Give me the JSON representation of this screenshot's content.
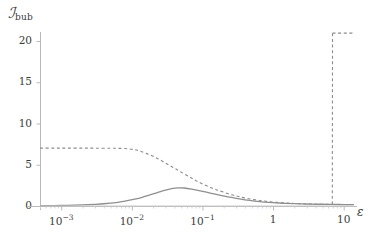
{
  "chart_data": {
    "type": "line",
    "title": "",
    "ylabel": "ℐ_bub",
    "ylabel_main": "ℐ",
    "ylabel_sub": "bub",
    "xlabel": "ε",
    "xscale": "log",
    "yscale": "linear",
    "xlim": [
      0.0005,
      14
    ],
    "ylim": [
      -0.9,
      22.5
    ],
    "yticks": [
      0,
      5,
      10,
      15,
      20
    ],
    "ytick_labels": [
      "0",
      "5",
      "10",
      "15",
      "20"
    ],
    "xticks": [
      0.001,
      0.01,
      0.1,
      1,
      10
    ],
    "xtick_labels": [
      "10−3",
      "10−2",
      "10−1",
      "1",
      "10"
    ],
    "xtick_mantissa": [
      "10",
      "10",
      "10",
      "1",
      "10"
    ],
    "xtick_exponent": [
      "-3",
      "-2",
      "-1",
      "",
      ""
    ],
    "grid": false,
    "legend": "none",
    "frame": false,
    "axis_color": "#b9b9b9",
    "series": [
      {
        "name": "dashed-step",
        "style": "dashed",
        "color": "#8c8c8c",
        "linewidth": 1.1,
        "dasharray": "3,2.6",
        "x": [
          0.0005,
          0.0008,
          0.0012,
          0.002,
          0.003,
          0.005,
          0.007,
          0.009,
          0.011,
          0.013,
          0.016,
          0.02,
          0.025,
          0.032,
          0.04,
          0.05,
          0.065,
          0.08,
          0.1,
          0.13,
          0.16,
          0.2,
          0.26,
          0.32,
          0.4,
          0.5,
          0.65,
          0.8,
          1.0,
          1.3,
          1.6,
          2.0,
          2.6,
          3.2,
          4.0,
          5.0,
          6.0,
          6.9,
          6.95,
          8.0,
          10.0,
          12.0,
          14.0
        ],
        "y": [
          7.02,
          7.02,
          7.02,
          7.02,
          7.01,
          7.0,
          6.98,
          6.93,
          6.82,
          6.65,
          6.38,
          6.02,
          5.6,
          5.05,
          4.6,
          4.1,
          3.55,
          3.1,
          2.68,
          2.25,
          1.95,
          1.67,
          1.36,
          1.16,
          0.97,
          0.82,
          0.67,
          0.57,
          0.48,
          0.4,
          0.35,
          0.31,
          0.27,
          0.24,
          0.22,
          0.21,
          0.2,
          0.2,
          20.95,
          20.95,
          20.95,
          20.95,
          20.95
        ]
      },
      {
        "name": "solid-curve",
        "style": "solid",
        "color": "#8f8f8f",
        "linewidth": 1.3,
        "x": [
          0.0005,
          0.0008,
          0.0012,
          0.002,
          0.003,
          0.004,
          0.006,
          0.008,
          0.011,
          0.014,
          0.018,
          0.023,
          0.03,
          0.038,
          0.045,
          0.055,
          0.07,
          0.09,
          0.11,
          0.14,
          0.18,
          0.23,
          0.3,
          0.4,
          0.55,
          0.75,
          1.0,
          1.4,
          2.0,
          3.0,
          4.5,
          6.5,
          9.0,
          12.0,
          14.0
        ],
        "y": [
          0.03,
          0.05,
          0.08,
          0.13,
          0.2,
          0.27,
          0.42,
          0.58,
          0.82,
          1.05,
          1.35,
          1.62,
          1.92,
          2.13,
          2.2,
          2.18,
          2.05,
          1.86,
          1.7,
          1.5,
          1.28,
          1.1,
          0.92,
          0.75,
          0.6,
          0.48,
          0.4,
          0.33,
          0.28,
          0.24,
          0.21,
          0.19,
          0.18,
          0.17,
          0.17
        ]
      },
      {
        "name": "baseline-zero",
        "style": "solid",
        "color": "#c8c8c8",
        "linewidth": 1.0,
        "x": [
          0.0005,
          14
        ],
        "y": [
          0,
          0
        ]
      }
    ]
  }
}
